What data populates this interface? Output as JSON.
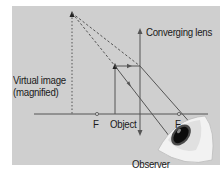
{
  "diagram": {
    "type": "converging lens ray diagram (magnifying glass)",
    "labels": {
      "lens": "Converging lens",
      "virtual_image_line1": "Virtual image",
      "virtual_image_line2": "(magnified)",
      "focal_left": "F",
      "object": "Object",
      "focal_right": "F",
      "observer": "Observer"
    },
    "colors": {
      "background": "#cfcfcf",
      "lines": "#555555",
      "text": "#1a1a1a"
    }
  }
}
